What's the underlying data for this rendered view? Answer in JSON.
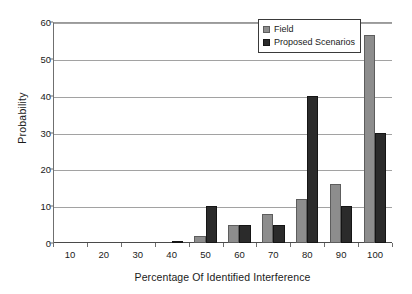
{
  "chart_data": {
    "type": "bar",
    "title": "",
    "xlabel": "Percentage Of Identified Interference",
    "ylabel": "Probability",
    "categories": [
      "10",
      "20",
      "30",
      "40",
      "50",
      "60",
      "70",
      "80",
      "90",
      "100"
    ],
    "series": [
      {
        "name": "Field",
        "color": "#8d8d8d",
        "values": [
          0,
          0,
          0,
          0,
          2,
          5,
          8,
          12,
          16,
          56.5
        ]
      },
      {
        "name": "Proposed Scenarios",
        "color": "#2b2b2b",
        "values": [
          0,
          0,
          0,
          0.5,
          10,
          5,
          5,
          40,
          10,
          30
        ]
      }
    ],
    "xlim": [
      5,
      105
    ],
    "ylim": [
      0,
      60
    ],
    "yticks": [
      0,
      10,
      20,
      30,
      40,
      50,
      60
    ],
    "xticks": [
      "10",
      "20",
      "30",
      "40",
      "50",
      "60",
      "70",
      "80",
      "90",
      "100"
    ],
    "grid": "horizontal",
    "legend_position": "top-right"
  },
  "legend": {
    "items": [
      {
        "label": "Field",
        "swatch": "field-swatch"
      },
      {
        "label": "Proposed Scenarios",
        "swatch": "proposed-swatch"
      }
    ]
  }
}
